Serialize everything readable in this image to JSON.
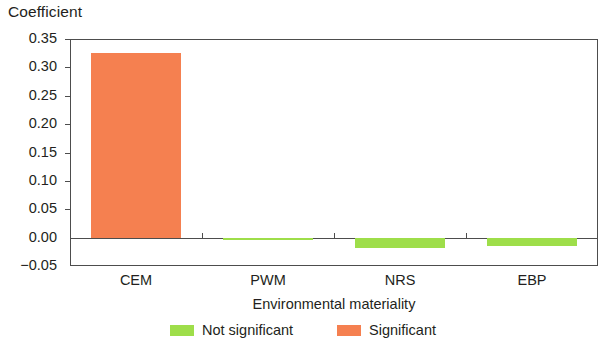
{
  "chart_data": {
    "type": "bar",
    "title": "Coefficient",
    "xlabel": "Environmental materiality",
    "ylabel": "Coefficient",
    "categories": [
      "CEM",
      "PWM",
      "NRS",
      "EBP"
    ],
    "values": [
      0.325,
      -0.005,
      -0.018,
      -0.015
    ],
    "point_labels": [
      "Significant",
      "Not significant",
      "Not significant",
      "Not significant"
    ],
    "bar_colors": [
      "#f58050",
      "#9ede4a",
      "#9ede4a",
      "#9ede4a"
    ],
    "ylim": [
      -0.05,
      0.35
    ],
    "yticks": [
      0.35,
      0.3,
      0.25,
      0.2,
      0.15,
      0.1,
      0.05,
      0.0,
      -0.05
    ],
    "ytick_labels": [
      "0.35",
      "0.30",
      "0.25",
      "0.20",
      "0.15",
      "0.10",
      "0.05",
      "0.00",
      "−0.05"
    ],
    "grid": false,
    "legend_position": "bottom-center",
    "legend": [
      {
        "label": "Not significant",
        "color": "#9ede4a"
      },
      {
        "label": "Significant",
        "color": "#f58050"
      }
    ],
    "colors": {
      "significant": "#f58050",
      "not_significant": "#9ede4a",
      "axis": "#4d4d4d",
      "text": "#231f20",
      "background": "#ffffff"
    }
  }
}
